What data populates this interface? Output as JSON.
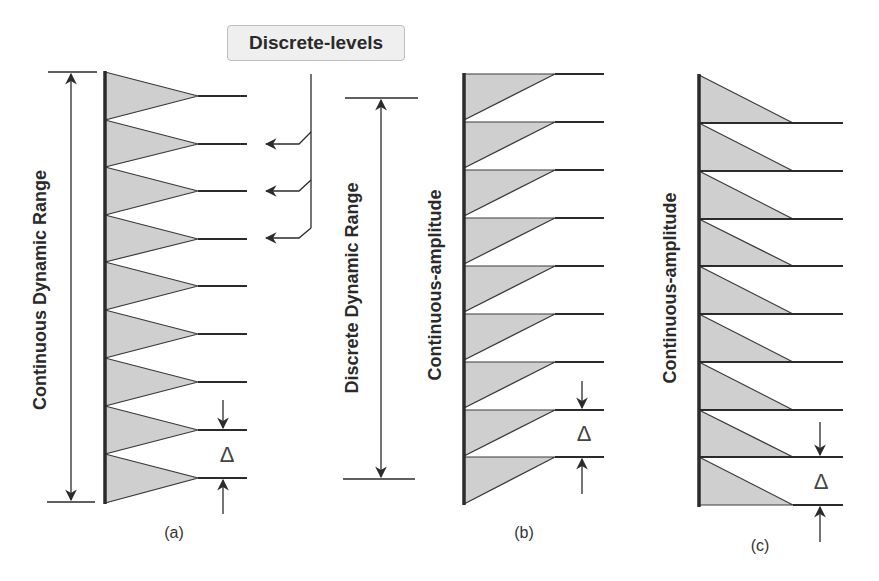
{
  "callout": {
    "label": "Discrete-levels"
  },
  "panels": [
    {
      "id": "a",
      "caption": "(a)",
      "range_label": "Continuous Dynamic Range",
      "step_label": "Δ",
      "shape": "isosceles-triangle",
      "levels": 9
    },
    {
      "id": "b",
      "caption": "(b)",
      "range_label": "Discrete Dynamic Range",
      "axis_label": "Continuous-amplitude",
      "step_label": "Δ",
      "shape": "right-triangle-top-flat",
      "levels": 9
    },
    {
      "id": "c",
      "caption": "(c)",
      "axis_label": "Continuous-amplitude",
      "step_label": "Δ",
      "shape": "right-triangle-bottom-flat",
      "levels": 9
    }
  ],
  "colors": {
    "fill": "#cfcfcf",
    "stroke": "#2b2b2b",
    "text": "#2a2a2a"
  }
}
